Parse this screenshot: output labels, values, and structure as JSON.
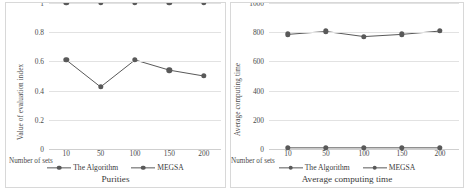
{
  "chart_data": [
    {
      "type": "line",
      "title": "Purities",
      "xlabel": "Number of sets",
      "ylabel": "Value of evaluation index",
      "x": [
        10,
        50,
        100,
        150,
        200
      ],
      "xticklabels": [
        "10",
        "50",
        "100",
        "150",
        "200"
      ],
      "yticklabels": [
        "0",
        "0.2",
        "0.4",
        "0.6",
        "0.8",
        "1"
      ],
      "ytickvalues": [
        0,
        0.2,
        0.4,
        0.6,
        0.8,
        1
      ],
      "ylim": [
        0,
        1
      ],
      "grid": "horizontal",
      "legend_position": "bottom",
      "series": [
        {
          "name": "The Algorithm",
          "color": "#595959",
          "values": [
            0.61,
            0.425,
            0.61,
            0.54,
            0.5
          ]
        },
        {
          "name": "MEGSA",
          "color": "#595959",
          "values": [
            1,
            1,
            1,
            1,
            1
          ]
        }
      ]
    },
    {
      "type": "line",
      "title": "Average computing time",
      "xlabel": "Number of sets",
      "ylabel": "Average computing time",
      "x": [
        10,
        50,
        100,
        150,
        200
      ],
      "xticklabels": [
        "10",
        "50",
        "100",
        "150",
        "200"
      ],
      "yticklabels": [
        "0",
        "200",
        "400",
        "600",
        "800",
        "1000"
      ],
      "ytickvalues": [
        0,
        200,
        400,
        600,
        800,
        1000
      ],
      "ylim": [
        0,
        1000
      ],
      "grid": "horizontal",
      "legend_position": "bottom",
      "series": [
        {
          "name": "The Algorithm",
          "color": "#595959",
          "values": [
            8,
            8,
            8,
            8,
            8
          ]
        },
        {
          "name": "MEGSA",
          "color": "#595959",
          "values": [
            785,
            805,
            770,
            785,
            808
          ]
        }
      ]
    }
  ],
  "panels": [
    {
      "caption": "Purities",
      "ylabel": "Value of evaluation index",
      "xlabel": "Number of sets"
    },
    {
      "caption": "Average computing time",
      "ylabel": "Average computing time",
      "xlabel": "Number of sets"
    }
  ],
  "colors": {
    "series": "#595959",
    "grid": "#e2e2e2",
    "border": "#d8d8d8",
    "text": "#3a3a3a"
  }
}
